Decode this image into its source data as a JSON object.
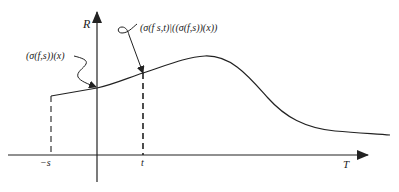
{
  "diagram": {
    "axes": {
      "vertical_label": "R",
      "horizontal_label": "T"
    },
    "ticks": {
      "neg_s": "−s",
      "t": "t"
    },
    "annotations": {
      "value_at_origin": "(σ(f,s))(x)",
      "value_at_t": "(σ(f s,t)|((σ(f,s))(x))"
    },
    "colors": {
      "ink": "#222222",
      "background": "#ffffff"
    }
  }
}
